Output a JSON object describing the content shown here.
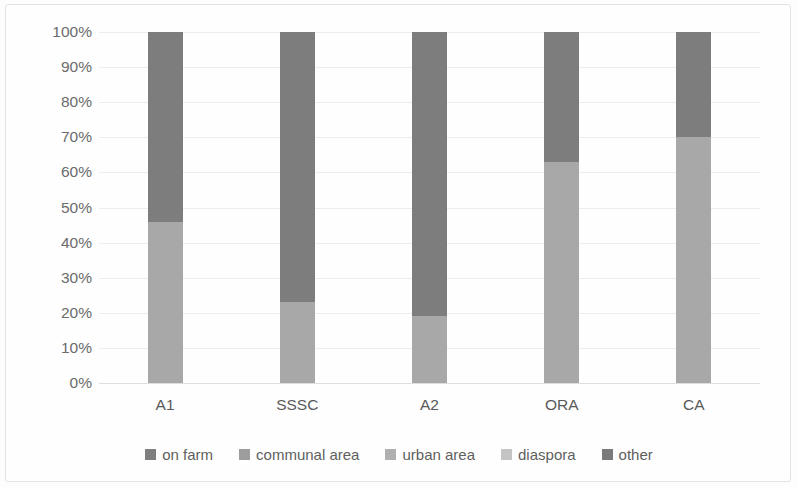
{
  "chart_data": {
    "type": "bar",
    "stacked": true,
    "stack_mode": "percent",
    "title": "",
    "subtitle": "",
    "xlabel": "",
    "ylabel": "",
    "categories": [
      "A1",
      "SSSC",
      "A2",
      "ORA",
      "CA"
    ],
    "ylim": [
      0,
      100
    ],
    "yticks": [
      0,
      10,
      20,
      30,
      40,
      50,
      60,
      70,
      80,
      90,
      100
    ],
    "ytick_labels": [
      "0%",
      "10%",
      "20%",
      "30%",
      "40%",
      "50%",
      "60%",
      "70%",
      "80%",
      "90%",
      "100%"
    ],
    "grid": true,
    "legend_position": "bottom",
    "series": [
      {
        "name": "on farm",
        "color": "#7f7f7f",
        "values": [
          0,
          0,
          0,
          0,
          0
        ]
      },
      {
        "name": "communal area",
        "color": "#a0a0a0",
        "values": [
          0,
          0,
          0,
          0,
          0
        ]
      },
      {
        "name": "urban area",
        "color": "#b4b4b4",
        "values": [
          0,
          0,
          0,
          0,
          0
        ]
      },
      {
        "name": "diaspora",
        "color": "#a8a8a8",
        "values": [
          46,
          23,
          19,
          63,
          70
        ]
      },
      {
        "name": "other",
        "color": "#7d7d7d",
        "values": [
          54,
          77,
          81,
          37,
          30
        ]
      }
    ]
  },
  "axis": {
    "y_labels": [
      "100%",
      "90%",
      "80%",
      "70%",
      "60%",
      "50%",
      "40%",
      "30%",
      "20%",
      "10%",
      "0%"
    ],
    "x_labels": [
      "A1",
      "SSSC",
      "A2",
      "ORA",
      "CA"
    ]
  },
  "legend": {
    "items": [
      {
        "label": "on farm",
        "color": "#7f7f7f"
      },
      {
        "label": "communal area",
        "color": "#9d9d9d"
      },
      {
        "label": "urban area",
        "color": "#b0b0b0"
      },
      {
        "label": "diaspora",
        "color": "#c4c4c4"
      },
      {
        "label": "other",
        "color": "#7a7a7a"
      }
    ]
  },
  "colors": {
    "grid": "#ededed",
    "text": "#6b6b6b",
    "background": "#fefefe",
    "border": "#e3e3e3"
  }
}
